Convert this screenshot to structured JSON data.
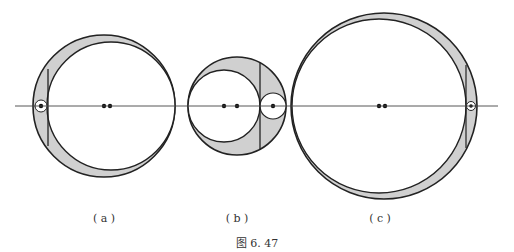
{
  "figure": {
    "caption": "图 6. 47",
    "panels": [
      {
        "id": "a",
        "label": "( a )"
      },
      {
        "id": "b",
        "label": "( b )"
      },
      {
        "id": "c",
        "label": "( c )"
      }
    ]
  },
  "colors": {
    "stroke": "#222222",
    "fill": "#d0d0d0",
    "background": "#ffffff"
  }
}
